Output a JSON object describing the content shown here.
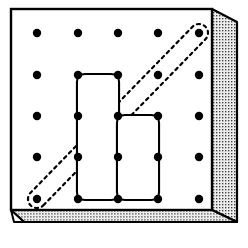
{
  "figure": {
    "title": "Geoboard with rubber band polygons",
    "caption": "",
    "background_color": "#ffffff"
  },
  "board": {
    "name": "geoboard",
    "face_color": "#ffffff",
    "outline_color": "#000000",
    "edge_fill_color": "#e8e8e8",
    "edge_stipple_color": "#4a4a4a",
    "outline_width": 2.2,
    "face": {
      "top_left": [
        11,
        9
      ],
      "top_right": [
        212,
        9
      ],
      "bottom_right": [
        212,
        210
      ],
      "bottom_left": [
        11,
        210
      ]
    },
    "right_edge": {
      "top_outer": [
        237,
        22
      ],
      "bottom_outer": [
        237,
        210
      ],
      "bevel_top": [
        212,
        9
      ],
      "bevel_bottom": [
        212,
        210
      ]
    },
    "bottom_edge": {
      "left_outer": [
        24,
        235
      ],
      "right_outer": [
        237,
        235
      ],
      "bevel_left": [
        11,
        210
      ],
      "bevel_right": [
        212,
        210
      ]
    }
  },
  "pegs": {
    "name": "peg-grid",
    "rows": 5,
    "columns": 5,
    "radius": 4.2,
    "color": "#000000",
    "x_positions": [
      37,
      78,
      118,
      158,
      199
    ],
    "y_positions": [
      33,
      75,
      116,
      157,
      199
    ],
    "labels": {
      "col_ids": [
        "c1",
        "c2",
        "c3",
        "c4",
        "c5"
      ],
      "row_ids": [
        "r1",
        "r2",
        "r3",
        "r4",
        "r5"
      ]
    }
  },
  "bands": [
    {
      "id": "band-left-polygon",
      "name": "solid-rubber-band-left",
      "style": "solid",
      "stroke_color": "#000000",
      "stroke_width": 4.2,
      "fill": "none",
      "corner_radius": 7,
      "peg_vertices": [
        {
          "col": 2,
          "row": 2
        },
        {
          "col": 3,
          "row": 2
        },
        {
          "col": 3,
          "row": 3
        },
        {
          "col": 3,
          "row": 5
        },
        {
          "col": 2,
          "row": 5
        }
      ],
      "points": [
        [
          78,
          75
        ],
        [
          118,
          75
        ],
        [
          118,
          116
        ],
        [
          118,
          199
        ],
        [
          78,
          199
        ]
      ]
    },
    {
      "id": "band-right-polygon",
      "name": "solid-rubber-band-right",
      "style": "solid",
      "stroke_color": "#000000",
      "stroke_width": 4.2,
      "fill": "none",
      "corner_radius": 7,
      "peg_vertices": [
        {
          "col": 3,
          "row": 3
        },
        {
          "col": 4,
          "row": 3
        },
        {
          "col": 4,
          "row": 5
        },
        {
          "col": 3,
          "row": 5
        }
      ],
      "points": [
        [
          118,
          116
        ],
        [
          158,
          116
        ],
        [
          158,
          199
        ],
        [
          118,
          199
        ]
      ]
    },
    {
      "id": "band-diagonal",
      "name": "dashed-rubber-band-diagonal",
      "style": "dashed",
      "stroke_color": "#000000",
      "stroke_width": 2.2,
      "dash_pattern": "3 4",
      "fill": "none",
      "band_half_width": 9,
      "peg_endpoints": [
        {
          "col": 1,
          "row": 5
        },
        {
          "col": 5,
          "row": 1
        }
      ],
      "points": [
        [
          37,
          199
        ],
        [
          199,
          33
        ]
      ]
    }
  ]
}
